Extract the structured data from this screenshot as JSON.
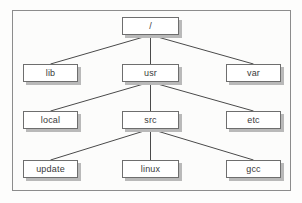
{
  "figure": {
    "background_color": "#fdfdfc",
    "frame_color": "#8c8c8c",
    "node_fill": "#ffffff",
    "node_border": "#6e6e6e",
    "node_shadow": "#b9b9b9",
    "edge_color": "#4a4a4a",
    "text_color": "#3a3a3a"
  },
  "tree": {
    "root_label": "/",
    "nodes": [
      {
        "id": "root",
        "label": "/",
        "x": 122,
        "y": 17,
        "w": 57,
        "h": 18,
        "level": 0
      },
      {
        "id": "lib",
        "label": "lib",
        "x": 23,
        "y": 64,
        "w": 55,
        "h": 18,
        "level": 1
      },
      {
        "id": "usr",
        "label": "usr",
        "x": 122,
        "y": 64,
        "w": 57,
        "h": 18,
        "level": 1
      },
      {
        "id": "var",
        "label": "var",
        "x": 226,
        "y": 64,
        "w": 55,
        "h": 18,
        "level": 1
      },
      {
        "id": "local",
        "label": "local",
        "x": 23,
        "y": 111,
        "w": 55,
        "h": 18,
        "level": 2
      },
      {
        "id": "src",
        "label": "src",
        "x": 122,
        "y": 111,
        "w": 57,
        "h": 18,
        "level": 2
      },
      {
        "id": "etc",
        "label": "etc",
        "x": 226,
        "y": 111,
        "w": 55,
        "h": 18,
        "level": 2
      },
      {
        "id": "update",
        "label": "update",
        "x": 23,
        "y": 160,
        "w": 55,
        "h": 18,
        "level": 3
      },
      {
        "id": "linux",
        "label": "linux",
        "x": 122,
        "y": 160,
        "w": 57,
        "h": 18,
        "level": 3
      },
      {
        "id": "gcc",
        "label": "gcc",
        "x": 226,
        "y": 160,
        "w": 55,
        "h": 18,
        "level": 3
      }
    ],
    "edges": [
      {
        "from": "root",
        "to": "lib"
      },
      {
        "from": "root",
        "to": "usr"
      },
      {
        "from": "root",
        "to": "var"
      },
      {
        "from": "usr",
        "to": "local"
      },
      {
        "from": "usr",
        "to": "src"
      },
      {
        "from": "usr",
        "to": "etc"
      },
      {
        "from": "src",
        "to": "update"
      },
      {
        "from": "src",
        "to": "linux"
      },
      {
        "from": "src",
        "to": "gcc"
      }
    ]
  }
}
